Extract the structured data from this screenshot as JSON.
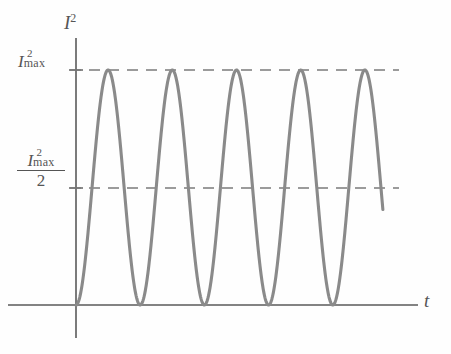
{
  "figure": {
    "kind": "physics-plot",
    "line_color": "#808080",
    "axis_color": "#555555",
    "dash_color": "#7a7a7a",
    "background": "#ffffff"
  },
  "axes": {
    "y_title": "I",
    "y_title_exponent": "2",
    "x_title": "t",
    "origin_px": {
      "x": 76,
      "y": 305
    },
    "x_axis_end_px": 418,
    "y_axis_top_px": 38,
    "y_axis_bottom_px": 338
  },
  "tick_labels": {
    "max": {
      "base": "I",
      "exponent": "2",
      "subscript": "max",
      "y_px": 70
    },
    "half": {
      "base": "I",
      "exponent": "2",
      "subscript": "max",
      "denominator": "2",
      "y_px": 188
    }
  },
  "gridlines": [
    {
      "name": "i2-max-dashed-line",
      "value_label": "I2max",
      "y_px": 70,
      "x_start_px": 70,
      "x_end_px": 399
    },
    {
      "name": "half-i2-max-dashed-line",
      "value_label": "I2max/2",
      "y_px": 188,
      "x_start_px": 70,
      "x_end_px": 399
    }
  ],
  "chart_data": {
    "type": "line",
    "title": "",
    "subtitle": "",
    "xlabel": "t",
    "ylabel": "I^2",
    "grid": true,
    "legend": null,
    "function": "I^2 = I_max^2 * sin^2(pi * t / T)",
    "xlim": [
      0,
      5.05
    ],
    "ylim": [
      0,
      1.08
    ],
    "y_tick_values": [
      0.5,
      1.0
    ],
    "y_tick_labels": [
      "I2max/2",
      "I2max"
    ],
    "x_tick_values": [],
    "x_tick_labels": [],
    "period": 1.0,
    "num_full_cycles": 5,
    "series": [
      {
        "name": "I squared",
        "color": "#808080",
        "peaks_x": [
          0.5,
          1.5,
          2.5,
          3.5,
          4.5
        ],
        "peaks_y": [
          1.0,
          1.0,
          1.0,
          1.0,
          1.0
        ],
        "zeros_x": [
          0.0,
          1.0,
          2.0,
          3.0,
          4.0,
          5.0
        ],
        "half_max_crossings_x": [
          0.25,
          0.75,
          1.25,
          1.75,
          2.25,
          2.75,
          3.25,
          3.75,
          4.25,
          4.75
        ],
        "x_end_truncated": 4.78,
        "y_end_truncated": 0.43
      }
    ]
  }
}
